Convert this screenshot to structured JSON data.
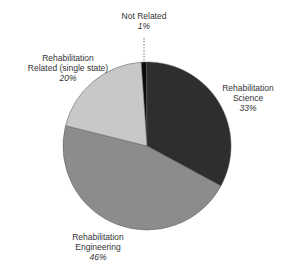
{
  "chart_data": {
    "type": "pie",
    "title": "",
    "categories": [
      "Not Related",
      "Rehabilitation Science",
      "Rehabilitation Engineering",
      "Rehabilitation Related (single state)"
    ],
    "values": [
      1,
      33,
      46,
      20
    ],
    "value_labels": [
      "1%",
      "33%",
      "46%",
      "20%"
    ],
    "colors": [
      "#0a0a0a",
      "#2e2e2e",
      "#8c8c8c",
      "#c8c8c8"
    ],
    "start_angle_deg": -4,
    "direction": "clockwise",
    "legend": "none (direct labels)"
  },
  "labels": {
    "not_related": {
      "line1": "Not Related",
      "pct": "1%"
    },
    "science": {
      "line1": "Rehabilitation",
      "line2": "Science",
      "pct": "33%"
    },
    "engineering": {
      "line1": "Rehabilitation",
      "line2": "Engineering",
      "pct": "46%"
    },
    "related": {
      "line1": "Rehabilitation",
      "line2": "Related (single state)",
      "pct": "20%"
    }
  }
}
